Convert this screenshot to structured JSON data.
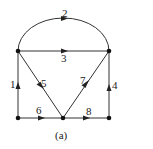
{
  "caption": "(a)",
  "colors": {
    "line": "#333333",
    "node": "#111111",
    "background": "#ffffff"
  },
  "nodes": [
    {
      "id": "TL",
      "x": 18,
      "y": 51
    },
    {
      "id": "TR",
      "x": 109,
      "y": 51
    },
    {
      "id": "BL",
      "x": 18,
      "y": 118
    },
    {
      "id": "BM",
      "x": 63,
      "y": 118
    },
    {
      "id": "BR",
      "x": 109,
      "y": 118
    }
  ],
  "edges": [
    {
      "label": "1",
      "from": "BL",
      "to": "TL"
    },
    {
      "label": "2",
      "from": "TL",
      "to": "TR",
      "shape": "arc"
    },
    {
      "label": "3",
      "from": "TL",
      "to": "TR"
    },
    {
      "label": "4",
      "from": "BR",
      "to": "TR"
    },
    {
      "label": "5",
      "from": "TL",
      "to": "BM"
    },
    {
      "label": "6",
      "from": "BL",
      "to": "BM"
    },
    {
      "label": "7",
      "from": "BM",
      "to": "TR"
    },
    {
      "label": "8",
      "from": "BM",
      "to": "BR"
    }
  ],
  "labels": {
    "e1": "1",
    "e2": "2",
    "e3": "3",
    "e4": "4",
    "e5": "5",
    "e6": "6",
    "e7": "7",
    "e8": "8"
  }
}
